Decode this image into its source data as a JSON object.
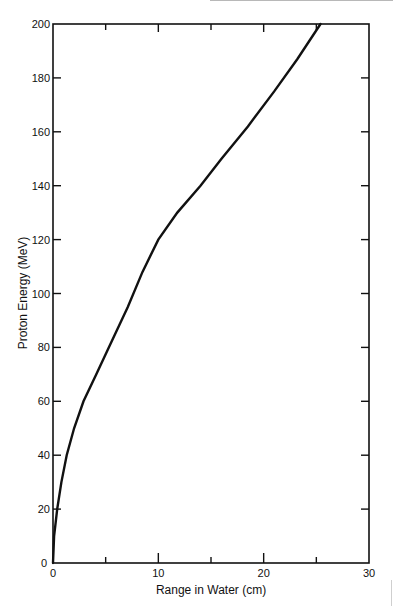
{
  "chart_data": {
    "type": "line",
    "title": "",
    "xlabel": "Range in Water (cm)",
    "ylabel": "Proton Energy (MeV)",
    "xlim": [
      0,
      30
    ],
    "ylim": [
      0,
      200
    ],
    "x_ticks": [
      "0",
      "10",
      "20",
      "30"
    ],
    "y_ticks": [
      "0",
      "20",
      "40",
      "60",
      "80",
      "100",
      "120",
      "140",
      "160",
      "180",
      "200"
    ],
    "grid": false,
    "legend": null,
    "series": [
      {
        "name": "Proton range-energy curve",
        "x": [
          0,
          0.1,
          0.4,
          0.8,
          1.3,
          2.0,
          2.9,
          4.1,
          5.3,
          7.1,
          8.5,
          10.0,
          11.8,
          14.0,
          16.0,
          18.5,
          21.0,
          23.2,
          25.4
        ],
        "y": [
          0,
          10,
          20,
          30,
          40,
          50,
          60,
          70,
          80,
          95,
          108,
          120,
          130,
          140,
          150,
          162,
          175,
          187,
          200
        ]
      }
    ]
  },
  "labels": {
    "xlabel": "Range in Water (cm)",
    "ylabel": "Proton Energy (MeV)",
    "y_origin": "0",
    "x_origin": "0"
  }
}
